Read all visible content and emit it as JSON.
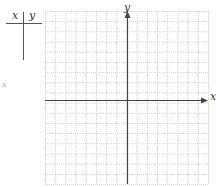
{
  "table": {
    "headers": [
      "x",
      "y"
    ],
    "rows": []
  },
  "graph": {
    "x_label": "x",
    "y_label": "y",
    "side_label": "x",
    "grid": {
      "left": 45,
      "top": 11,
      "right": 208,
      "bottom": 184,
      "cols": 16,
      "rows": 17
    },
    "axis": {
      "y_axis_x": 127,
      "x_axis_y": 100
    },
    "colors": {
      "grid": "#c8c8c8",
      "axis": "#444444"
    }
  }
}
